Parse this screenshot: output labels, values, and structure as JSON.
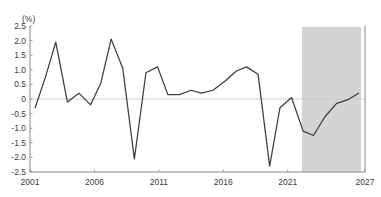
{
  "chart_data": {
    "type": "line",
    "title": "",
    "subtitle": "",
    "xlabel": "",
    "ylabel": "(%)",
    "ylim": [
      -2.5,
      2.5
    ],
    "xlim": [
      2001,
      2027
    ],
    "grid": false,
    "zero_line": true,
    "legend": "none",
    "y_ticks": [
      "2.5",
      "2.0",
      "1.5",
      "1.0",
      "0.5",
      "0",
      "-0.5",
      "-1.0",
      "-1.5",
      "-2.0",
      "-2.5"
    ],
    "y_tick_values": [
      2.5,
      2.0,
      1.5,
      1.0,
      0.5,
      0,
      -0.5,
      -1.0,
      -1.5,
      -2.0,
      -2.5
    ],
    "x_ticks": [
      "2001",
      "2006",
      "2011",
      "2016",
      "2021",
      "2027"
    ],
    "x_tick_values": [
      2001,
      2006,
      2011,
      2016,
      2021,
      2027
    ],
    "x": [
      2001,
      2002,
      2003,
      2004,
      2005,
      2006,
      2007,
      2008,
      2009,
      2010,
      2011,
      2012,
      2013,
      2014,
      2015,
      2016,
      2017,
      2018,
      2019,
      2020,
      2021,
      2022,
      2023,
      2024,
      2025,
      2026,
      2027
    ],
    "series": [
      {
        "name": "series-1",
        "color": "#3c3c3c",
        "values": [
          -0.3,
          0.85,
          1.95,
          -0.1,
          0.2,
          -0.2,
          0.8,
          2.05,
          -2.05,
          -0.6,
          0.9,
          1.1,
          0.15,
          0.15,
          0.3,
          0.2,
          0.35,
          0.8,
          1.1,
          0.85,
          -2.3,
          -0.3,
          0.05,
          -1.05,
          -1.25,
          -0.6,
          0.05
        ]
      }
    ],
    "shaded_region": {
      "name": "forecast-band",
      "start": 2022.1,
      "end": 2026.7,
      "color": "#d4d4d4"
    },
    "line_points": [
      {
        "x": 2001.4,
        "y": -0.3
      },
      {
        "x": 2002.2,
        "y": 0.75
      },
      {
        "x": 2003.0,
        "y": 1.95
      },
      {
        "x": 2003.9,
        "y": -0.1
      },
      {
        "x": 2004.8,
        "y": 0.2
      },
      {
        "x": 2005.7,
        "y": -0.2
      },
      {
        "x": 2006.5,
        "y": 0.55
      },
      {
        "x": 2007.3,
        "y": 2.05
      },
      {
        "x": 2008.2,
        "y": 1.05
      },
      {
        "x": 2009.1,
        "y": -2.05
      },
      {
        "x": 2010.0,
        "y": 0.9
      },
      {
        "x": 2010.9,
        "y": 1.1
      },
      {
        "x": 2011.7,
        "y": 0.15
      },
      {
        "x": 2012.6,
        "y": 0.15
      },
      {
        "x": 2013.5,
        "y": 0.3
      },
      {
        "x": 2014.3,
        "y": 0.2
      },
      {
        "x": 2015.2,
        "y": 0.3
      },
      {
        "x": 2016.1,
        "y": 0.6
      },
      {
        "x": 2017.0,
        "y": 0.95
      },
      {
        "x": 2017.8,
        "y": 1.1
      },
      {
        "x": 2018.7,
        "y": 0.85
      },
      {
        "x": 2019.6,
        "y": -2.3
      },
      {
        "x": 2020.4,
        "y": -0.3
      },
      {
        "x": 2021.3,
        "y": 0.05
      },
      {
        "x": 2022.2,
        "y": -1.1
      },
      {
        "x": 2023.0,
        "y": -1.25
      },
      {
        "x": 2023.9,
        "y": -0.6
      },
      {
        "x": 2024.8,
        "y": -0.15
      },
      {
        "x": 2025.7,
        "y": -0.02
      },
      {
        "x": 2026.5,
        "y": 0.2
      }
    ]
  }
}
